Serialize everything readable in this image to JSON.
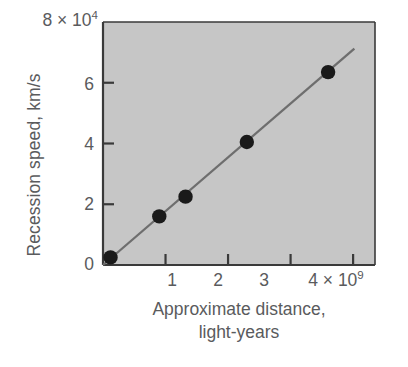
{
  "chart_data": {
    "type": "scatter",
    "title": "",
    "xlabel": "Approximate distance, light-years",
    "xlabel_line1": "Approximate distance,",
    "xlabel_line2": "light-years",
    "ylabel": "Recession speed, km/s",
    "x_multiplier": "× 10⁹",
    "x_multiplier_base": "10",
    "x_multiplier_exp": "9",
    "y_multiplier": "× 10⁴",
    "y_multiplier_base": "10",
    "y_multiplier_exp": "4",
    "x_unit_scale": 1000000000,
    "y_unit_scale": 10000,
    "xlim": [
      0,
      4.35
    ],
    "ylim": [
      0,
      8
    ],
    "xticks": [
      1,
      2,
      3,
      4
    ],
    "xtick_labels": [
      "1",
      "2",
      "3",
      "4"
    ],
    "x_last_tick_suffix": "4 × 10",
    "yticks": [
      0,
      2,
      4,
      6
    ],
    "ytick_labels": [
      "0",
      "2",
      "4",
      "6"
    ],
    "y_top_label": "8 × 10",
    "y_top_label_exp": "4",
    "grid": false,
    "legend": null,
    "series": [
      {
        "name": "Galaxy observations",
        "marker": "filled-circle",
        "marker_color": "#1a1a1a",
        "points": [
          {
            "x": 0.12,
            "y": 0.25
          },
          {
            "x": 0.9,
            "y": 1.6
          },
          {
            "x": 1.32,
            "y": 2.25
          },
          {
            "x": 2.3,
            "y": 4.05
          },
          {
            "x": 3.6,
            "y": 6.35
          }
        ]
      },
      {
        "name": "Hubble law fit",
        "type": "line",
        "line_color": "#6e6e6e",
        "from": {
          "x": 0.0,
          "y": 0.0
        },
        "to": {
          "x": 4.02,
          "y": 7.12
        },
        "slope": 1.771
      }
    ],
    "plot_bgcolor": "#c6c6c6",
    "axis_color": "#3a3a3a",
    "text_color": "#5a5b5d"
  }
}
